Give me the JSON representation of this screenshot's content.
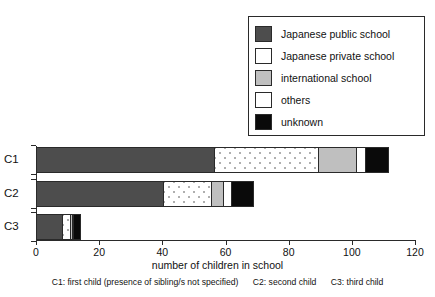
{
  "chart_data": {
    "type": "bar",
    "orientation": "horizontal",
    "stacked": true,
    "title": "",
    "xlabel": "number of children in school",
    "ylabel": "",
    "xlim": [
      0,
      120
    ],
    "xticks": [
      0,
      20,
      40,
      60,
      80,
      100,
      120
    ],
    "grid": false,
    "legend_position": "top-right",
    "categories": [
      "C1",
      "C2",
      "C3"
    ],
    "series": [
      {
        "name": "Japanese public school",
        "color": "#4d4d4d",
        "swatch": "dark-gray-fill",
        "values": [
          56,
          40,
          8
        ]
      },
      {
        "name": "Japanese private school",
        "color": "#ffffff",
        "swatch": "white-dotted-fill",
        "values": [
          33,
          15,
          2.5
        ]
      },
      {
        "name": "international school",
        "color": "#bfbfbf",
        "swatch": "light-gray-fill",
        "values": [
          12,
          4,
          0.5
        ]
      },
      {
        "name": "others",
        "color": "#ffffff",
        "swatch": "white-fill",
        "values": [
          3,
          2.5,
          0.5
        ]
      },
      {
        "name": "unknown",
        "color": "#0a0a0a",
        "swatch": "black-fill",
        "values": [
          7,
          7,
          2
        ]
      }
    ],
    "totals": [
      111,
      69,
      13
    ],
    "annotations": [
      "C1: first child (presence of sibling/s not specified)",
      "C2: second child",
      "C3: third child"
    ]
  },
  "legend": {
    "items": [
      {
        "label": "Japanese public school",
        "swatch_name": "swatch-japanese-public-school"
      },
      {
        "label": "Japanese private school",
        "swatch_name": "swatch-japanese-private-school"
      },
      {
        "label": "international school",
        "swatch_name": "swatch-international-school"
      },
      {
        "label": "others",
        "swatch_name": "swatch-others"
      },
      {
        "label": "unknown",
        "swatch_name": "swatch-unknown"
      }
    ]
  },
  "axis": {
    "x_label": "number of children in school",
    "x_tick_labels": [
      "0",
      "20",
      "40",
      "60",
      "80",
      "100",
      "120"
    ],
    "y_tick_labels": [
      "C1",
      "C2",
      "C3"
    ]
  },
  "caption": {
    "c1": "C1: first child (presence of sibling/s not specified)",
    "c2": "C2: second child",
    "c3": "C3: third child"
  }
}
